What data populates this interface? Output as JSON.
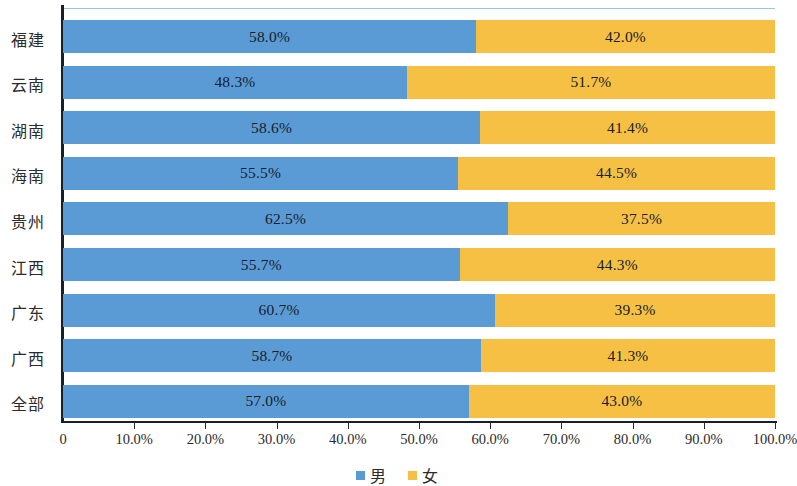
{
  "chart_data": {
    "type": "bar",
    "subtype": "stacked-horizontal-100percent",
    "title": "",
    "xlabel": "",
    "ylabel": "",
    "orientation": "horizontal",
    "stacked": true,
    "grid": false,
    "legend_position": "bottom-center",
    "xlim": [
      0,
      100
    ],
    "xticks": [
      0,
      10,
      20,
      30,
      40,
      50,
      60,
      70,
      80,
      90,
      100
    ],
    "xtick_labels": [
      "0",
      "10.0%",
      "20.0%",
      "30.0%",
      "40.0%",
      "50.0%",
      "60.0%",
      "70.0%",
      "80.0%",
      "90.0%",
      "100.0%"
    ],
    "categories": [
      "福建",
      "云南",
      "湖南",
      "海南",
      "贵州",
      "江西",
      "广东",
      "广西",
      "全部"
    ],
    "series": [
      {
        "name": "男",
        "color": "#5b9bd5",
        "values": [
          58.0,
          48.3,
          58.6,
          55.5,
          62.5,
          55.7,
          60.7,
          58.7,
          57.0
        ],
        "labels": [
          "58.0%",
          "48.3%",
          "58.6%",
          "55.5%",
          "62.5%",
          "55.7%",
          "60.7%",
          "58.7%",
          "57.0%"
        ]
      },
      {
        "name": "女",
        "color": "#f6c044",
        "values": [
          42.0,
          51.7,
          41.4,
          44.5,
          37.5,
          44.3,
          39.3,
          41.3,
          43.0
        ],
        "labels": [
          "42.0%",
          "51.7%",
          "41.4%",
          "44.5%",
          "37.5%",
          "44.3%",
          "39.3%",
          "41.3%",
          "43.0%"
        ]
      }
    ]
  },
  "legend": {
    "items": [
      {
        "label": "男",
        "color": "#5b9bd5"
      },
      {
        "label": "女",
        "color": "#f6c044"
      }
    ]
  },
  "colors": {
    "male": "#5b9bd5",
    "female": "#f6c044",
    "axis": "#17202a",
    "top_rule": "#9dc3e6",
    "text": "#2b2b2b"
  }
}
